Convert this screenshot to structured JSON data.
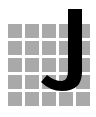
{
  "logo": {
    "letter": "J",
    "letter_color": "#000000",
    "grid": {
      "rows": 5,
      "columns": 5,
      "cell_color": "#a9a9a9"
    },
    "background": "#ffffff"
  }
}
